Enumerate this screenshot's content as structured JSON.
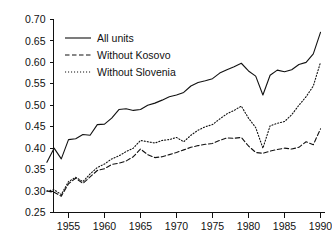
{
  "chart_data": {
    "type": "line",
    "title": "",
    "subtitle": "",
    "xlabel": "",
    "ylabel": "",
    "xlim": [
      1952,
      1990
    ],
    "ylim": [
      0.25,
      0.7
    ],
    "grid": false,
    "legend_position": "top-left",
    "x_tick_labels": [
      "1955",
      "1960",
      "1965",
      "1970",
      "1975",
      "1980",
      "1985",
      "1990"
    ],
    "x_ticks": [
      1955,
      1960,
      1965,
      1970,
      1975,
      1980,
      1985,
      1990
    ],
    "y_tick_labels": [
      "0.25",
      "0.30",
      "0.35",
      "0.40",
      "0.45",
      "0.50",
      "0.55",
      "0.60",
      "0.65",
      "0.70"
    ],
    "y_ticks": [
      0.25,
      0.3,
      0.35,
      0.4,
      0.45,
      0.5,
      0.55,
      0.6,
      0.65,
      0.7
    ],
    "x": [
      1952,
      1953,
      1954,
      1955,
      1956,
      1957,
      1958,
      1959,
      1960,
      1961,
      1962,
      1963,
      1964,
      1965,
      1966,
      1967,
      1968,
      1969,
      1970,
      1971,
      1972,
      1973,
      1974,
      1975,
      1976,
      1977,
      1978,
      1979,
      1980,
      1981,
      1982,
      1983,
      1984,
      1985,
      1986,
      1987,
      1988,
      1989,
      1990
    ],
    "series": [
      {
        "name": "All units",
        "style": "solid",
        "color": "#111111",
        "values": [
          0.367,
          0.4,
          0.375,
          0.42,
          0.422,
          0.432,
          0.43,
          0.455,
          0.456,
          0.47,
          0.49,
          0.492,
          0.488,
          0.49,
          0.5,
          0.505,
          0.512,
          0.52,
          0.524,
          0.53,
          0.545,
          0.553,
          0.557,
          0.562,
          0.575,
          0.583,
          0.59,
          0.598,
          0.58,
          0.568,
          0.524,
          0.57,
          0.582,
          0.578,
          0.583,
          0.595,
          0.6,
          0.62,
          0.67
        ]
      },
      {
        "name": "Without Kosovo",
        "style": "dashed",
        "color": "#111111",
        "values": [
          0.3,
          0.297,
          0.288,
          0.317,
          0.33,
          0.318,
          0.333,
          0.348,
          0.352,
          0.362,
          0.365,
          0.37,
          0.38,
          0.398,
          0.385,
          0.378,
          0.38,
          0.385,
          0.39,
          0.396,
          0.402,
          0.406,
          0.409,
          0.411,
          0.418,
          0.424,
          0.423,
          0.425,
          0.405,
          0.39,
          0.388,
          0.393,
          0.397,
          0.4,
          0.398,
          0.402,
          0.415,
          0.408,
          0.445
        ]
      },
      {
        "name": "Without Slovenia",
        "style": "dotted",
        "color": "#111111",
        "values": [
          0.3,
          0.303,
          0.292,
          0.322,
          0.332,
          0.322,
          0.34,
          0.355,
          0.363,
          0.375,
          0.382,
          0.392,
          0.4,
          0.418,
          0.415,
          0.412,
          0.418,
          0.42,
          0.425,
          0.415,
          0.43,
          0.442,
          0.45,
          0.455,
          0.468,
          0.48,
          0.488,
          0.498,
          0.47,
          0.448,
          0.4,
          0.452,
          0.458,
          0.462,
          0.478,
          0.5,
          0.52,
          0.545,
          0.6
        ]
      }
    ]
  },
  "legend": {
    "items": [
      {
        "label": "All units",
        "style": "solid"
      },
      {
        "label": "Without Kosovo",
        "style": "dashed"
      },
      {
        "label": "Without Slovenia",
        "style": "dotted"
      }
    ]
  }
}
